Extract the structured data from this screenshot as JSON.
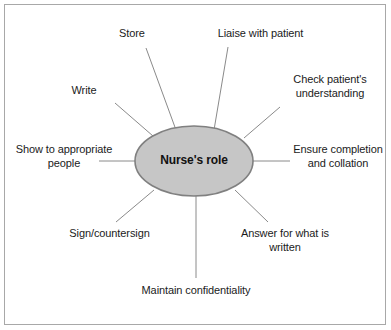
{
  "figure": {
    "kind": "spider-diagram",
    "frame_color": "#a8a8a8",
    "background": "#ffffff",
    "line_color": "#8a8a8a"
  },
  "center": {
    "label": "Nurse's role",
    "fill": "#c6c6c6",
    "stroke": "#808080",
    "cx": 194,
    "cy": 161,
    "rx": 59,
    "ry": 35
  },
  "nodes": [
    {
      "id": "store",
      "label": "Store",
      "align": "center",
      "x": 104,
      "y": 27,
      "width": 56,
      "line": {
        "x1": 146,
        "y1": 48,
        "x2": 176,
        "y2": 130
      }
    },
    {
      "id": "liaise-with-patient",
      "label": "Liaise with patient",
      "align": "center",
      "x": 203,
      "y": 27,
      "width": 115,
      "line": {
        "x1": 228,
        "y1": 47,
        "x2": 214,
        "y2": 130
      }
    },
    {
      "id": "check-patients-understanding",
      "label": "Check patient's\nunderstanding",
      "align": "center",
      "x": 280,
      "y": 73,
      "width": 100,
      "line": {
        "x1": 280,
        "y1": 107,
        "x2": 244,
        "y2": 138
      }
    },
    {
      "id": "ensure-completion-and-collation",
      "label": "Ensure completion\nand collation",
      "align": "center",
      "x": 288,
      "y": 143,
      "width": 100,
      "line": {
        "x1": 253,
        "y1": 161,
        "x2": 290,
        "y2": 161
      }
    },
    {
      "id": "answer-for-what-is-written",
      "label": "Answer for what is\nwritten",
      "align": "center",
      "x": 232,
      "y": 227,
      "width": 106,
      "line": {
        "x1": 235,
        "y1": 190,
        "x2": 268,
        "y2": 222
      }
    },
    {
      "id": "maintain-confidentiality",
      "label": "Maintain confidentiality",
      "align": "center",
      "x": 126,
      "y": 284,
      "width": 140,
      "line": {
        "x1": 196,
        "y1": 196,
        "x2": 196,
        "y2": 278
      }
    },
    {
      "id": "sign-countersign",
      "label": "Sign/countersign",
      "align": "center",
      "x": 57,
      "y": 227,
      "width": 105,
      "line": {
        "x1": 154,
        "y1": 190,
        "x2": 116,
        "y2": 222
      }
    },
    {
      "id": "show-to-appropriate-people",
      "label": "Show to appropriate\npeople",
      "align": "center",
      "x": 9,
      "y": 143,
      "width": 110,
      "line": {
        "x1": 135,
        "y1": 161,
        "x2": 99,
        "y2": 161
      }
    },
    {
      "id": "write",
      "label": "Write",
      "align": "center",
      "x": 58,
      "y": 84,
      "width": 52,
      "line": {
        "x1": 115,
        "y1": 103,
        "x2": 153,
        "y2": 136
      }
    }
  ]
}
